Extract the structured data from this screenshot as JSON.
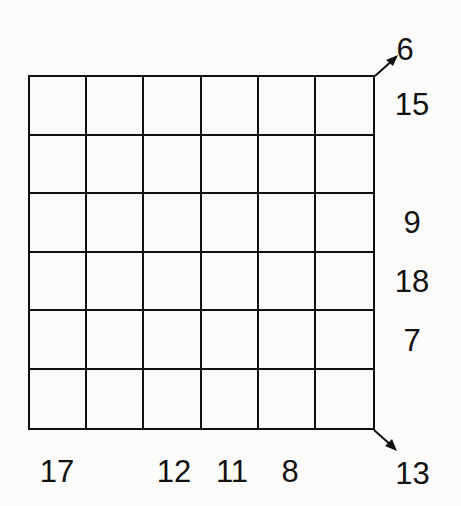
{
  "puzzle": {
    "rows": 6,
    "cols": 6,
    "cells": [
      [
        "",
        "",
        "",
        "",
        "",
        ""
      ],
      [
        "",
        "",
        "",
        "",
        "",
        ""
      ],
      [
        "",
        "",
        "",
        "",
        "",
        ""
      ],
      [
        "",
        "",
        "",
        "",
        "",
        ""
      ],
      [
        "",
        "",
        "",
        "",
        "",
        ""
      ],
      [
        "",
        "",
        "",
        "",
        "",
        ""
      ]
    ],
    "row_clues": [
      "15",
      "",
      "9",
      "18",
      "7",
      ""
    ],
    "col_clues": [
      "17",
      "",
      "12",
      "11",
      "8",
      ""
    ],
    "diagonal_clues": {
      "anti_diagonal_top_right": "6",
      "main_diagonal_bottom_right": "13"
    },
    "icons": {
      "top_arrow": "arrow-up-right-icon",
      "bottom_arrow": "arrow-down-right-icon"
    }
  }
}
